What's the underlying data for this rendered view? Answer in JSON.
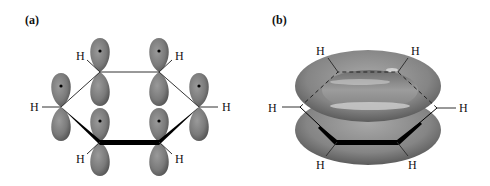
{
  "panels": [
    {
      "label": "(a)",
      "description": "benzene p orbitals"
    },
    {
      "label": "(b)",
      "description": "delocalized pi electron cloud"
    }
  ],
  "atoms": {
    "hydrogen": "H"
  },
  "colors": {
    "orbital": "#7a7a7a",
    "orbital_dark": "#555555",
    "bond": "#000000",
    "background": "#ffffff"
  }
}
